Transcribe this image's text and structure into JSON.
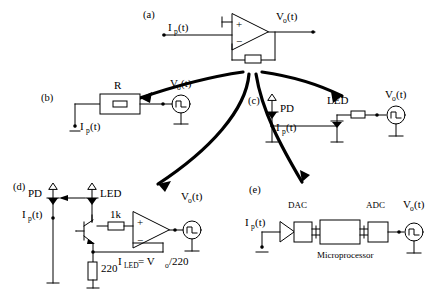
{
  "figure": {
    "title_present": false,
    "panels": [
      {
        "id": "(a)",
        "name": "transimpedance-amplifier",
        "labels": {
          "input_current": "I (t)",
          "input_current_main": "I",
          "input_current_sub": "p",
          "input_current_tail": "(t)",
          "output_voltage_main": "V",
          "output_voltage_sub": "o",
          "output_voltage_tail": "(t)",
          "opamp_plus": "+",
          "opamp_minus": "−"
        }
      },
      {
        "id": "(b)",
        "name": "resistor-sense",
        "labels": {
          "resistor": "R",
          "input_current_main": "I",
          "input_current_sub": "p",
          "input_current_tail": "(t)",
          "output_voltage_main": "V",
          "output_voltage_sub": "o",
          "output_voltage_tail": "(t)"
        }
      },
      {
        "id": "(c)",
        "name": "photodiode-led-series",
        "labels": {
          "photodiode": "PD",
          "led": "LED",
          "input_current_main": "I",
          "input_current_sub": "p",
          "input_current_tail": "(t)",
          "output_voltage_main": "V",
          "output_voltage_sub": "o",
          "output_voltage_tail": "(t)"
        }
      },
      {
        "id": "(d)",
        "name": "transistor-led-driver",
        "labels": {
          "photodiode": "PD",
          "led": "LED",
          "resistor_base": "1k",
          "resistor_emitter": "220",
          "input_current_main": "I",
          "input_current_sub": "p",
          "input_current_tail": "(t)",
          "output_voltage_main": "V",
          "output_voltage_sub": "o",
          "output_voltage_tail": "(t)",
          "equation_main": "I",
          "equation_sub": "LED",
          "equation_rest": " = V",
          "equation_rest_sub": "o",
          "equation_tail": " /220",
          "opamp_plus": "+",
          "opamp_minus": "−"
        }
      },
      {
        "id": "(e)",
        "name": "microprocessor-dac-adc",
        "labels": {
          "dac": "DAC",
          "adc": "ADC",
          "microprocessor": "Microprocessor",
          "input_current_main": "I",
          "input_current_sub": "p",
          "input_current_tail": "(t)",
          "output_voltage_main": "V",
          "output_voltage_sub": "o",
          "output_voltage_tail": "(t)"
        }
      }
    ],
    "arrows": [
      {
        "name": "arrow-to-panel-b",
        "from": "(a)",
        "to": "(b)"
      },
      {
        "name": "arrow-to-panel-c",
        "from": "(a)",
        "to": "(c)"
      },
      {
        "name": "arrow-to-panel-d",
        "from": "(a)",
        "to": "(d)"
      },
      {
        "name": "arrow-to-panel-e",
        "from": "(a)",
        "to": "(e)"
      }
    ],
    "colors": {
      "ink": "#000000",
      "paper": "#ffffff"
    }
  }
}
